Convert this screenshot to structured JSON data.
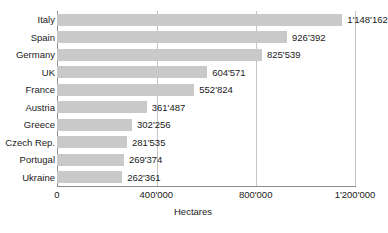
{
  "chart_data": {
    "type": "bar",
    "orientation": "horizontal",
    "title": "",
    "xlabel": "Hectares",
    "ylabel": "",
    "xlim": [
      0,
      1200000
    ],
    "xticks": [
      0,
      400000,
      800000,
      1200000
    ],
    "xtick_labels": [
      "0",
      "400'000",
      "800'000",
      "1'200'000"
    ],
    "grid": "vertical",
    "legend": "none",
    "bar_color": "#c9c9c9",
    "axis_color": "#8c8c8c",
    "grid_color": "#c4c4c4",
    "text_color": "#1a1a1a",
    "categories": [
      "Italy",
      "Spain",
      "Germany",
      "UK",
      "France",
      "Austria",
      "Greece",
      "Czech Rep.",
      "Portugal",
      "Ukraine"
    ],
    "values": [
      1148162,
      926392,
      825539,
      604571,
      552824,
      361487,
      302256,
      281535,
      269374,
      262361
    ],
    "value_labels": [
      "1'148'162",
      "926'392",
      "825'539",
      "604'571",
      "552'824",
      "361'487",
      "302'256",
      "281'535",
      "269'374",
      "262'361"
    ]
  },
  "footer": {
    "source_text": ""
  }
}
